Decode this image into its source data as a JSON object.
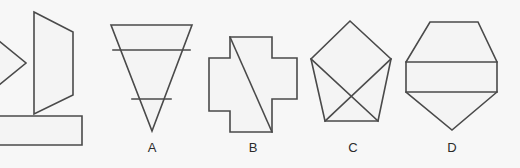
{
  "canvas": {
    "width": 520,
    "height": 168,
    "background_color": "#f7f7f7",
    "stroke_color": "#4a4a4a",
    "fill_color": "#f4f4f4",
    "label_color": "#2b2b2b"
  },
  "figure": {
    "labels": [
      {
        "id": "label-a",
        "text": "A",
        "x": 152,
        "y": 141,
        "shape_id": "shape-a"
      },
      {
        "id": "label-b",
        "text": "B",
        "x": 253,
        "y": 141,
        "shape_id": "shape-b"
      },
      {
        "id": "label-c",
        "text": "C",
        "x": 353,
        "y": 141,
        "shape_id": "shape-c"
      },
      {
        "id": "label-d",
        "text": "D",
        "x": 452,
        "y": 141,
        "shape_id": "shape-d"
      }
    ],
    "shapes": [
      {
        "id": "shape-cropped-triangle-left",
        "name": "cropped-triangle",
        "label": "",
        "cropped": true,
        "outline_points": "-34,14 26,63 -34,112",
        "inner_lines": []
      },
      {
        "id": "shape-cropped-quad",
        "name": "cropped-quadrilateral",
        "label": "",
        "cropped": false,
        "outline_points": "34,12 73,32 73,95 34,114",
        "inner_lines": []
      },
      {
        "id": "shape-cropped-rectangle",
        "name": "cropped-rectangle",
        "label": "",
        "cropped": true,
        "outline_points": "-30,116 82,116 82,145 -30,145",
        "inner_lines": []
      },
      {
        "id": "shape-a",
        "name": "inverted-triangle-with-bands",
        "label": "A",
        "cropped": false,
        "outline_points": "111,25 192,25 152,131",
        "inner_lines": [
          {
            "x1": 113,
            "y1": 50,
            "x2": 190,
            "y2": 50
          },
          {
            "x1": 132,
            "y1": 99,
            "x2": 171,
            "y2": 99
          }
        ]
      },
      {
        "id": "shape-b",
        "name": "cross-with-diagonal",
        "label": "B",
        "cropped": false,
        "outline_points": "230,37 272,37 272,58 297,58 297,99 272,99 272,132 230,132 230,111 209,111 209,58 230,58",
        "inner_lines": [
          {
            "x1": 230,
            "y1": 37,
            "x2": 272,
            "y2": 132
          }
        ]
      },
      {
        "id": "shape-c",
        "name": "pentagon-with-crossed-diagonals",
        "label": "C",
        "cropped": false,
        "outline_points": "350,21 391,59 378,121 325,121 311,59",
        "inner_lines": [
          {
            "x1": 325,
            "y1": 121,
            "x2": 391,
            "y2": 59
          },
          {
            "x1": 378,
            "y1": 121,
            "x2": 311,
            "y2": 59
          }
        ]
      },
      {
        "id": "shape-d",
        "name": "hexagon-with-bands",
        "label": "D",
        "cropped": false,
        "outline_points": "430,22 478,22 497,62 497,92 452,130 406,92 406,62",
        "inner_lines": [
          {
            "x1": 406,
            "y1": 62,
            "x2": 497,
            "y2": 62
          },
          {
            "x1": 406,
            "y1": 92,
            "x2": 497,
            "y2": 92
          }
        ]
      }
    ]
  }
}
